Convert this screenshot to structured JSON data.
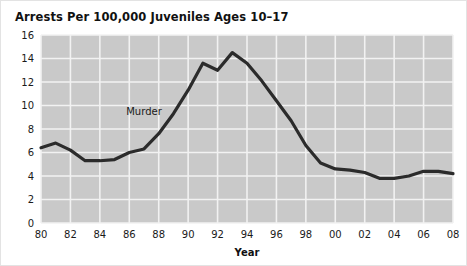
{
  "chart_data": {
    "type": "line",
    "title": "Arrests Per 100,000 Juveniles Ages 10–17",
    "xlabel": "Year",
    "ylabel": "",
    "xlim": [
      1980,
      2008
    ],
    "ylim": [
      0,
      16
    ],
    "grid": true,
    "legend_position": "inline-annotation",
    "y_ticks": [
      0,
      2,
      4,
      6,
      8,
      10,
      12,
      14,
      16
    ],
    "y_tick_labels": [
      "0",
      "2",
      "4",
      "6",
      "8",
      "10",
      "12",
      "14",
      "16"
    ],
    "x_ticks": [
      1980,
      1982,
      1984,
      1986,
      1988,
      1990,
      1992,
      1994,
      1996,
      1998,
      2000,
      2002,
      2004,
      2006,
      2008
    ],
    "x_tick_labels": [
      "80",
      "82",
      "84",
      "86",
      "88",
      "90",
      "92",
      "94",
      "96",
      "98",
      "00",
      "02",
      "04",
      "06",
      "08"
    ],
    "annotations": [
      {
        "text": "Murder",
        "x": 1987,
        "y": 9.2
      }
    ],
    "series": [
      {
        "name": "Murder",
        "color": "#2b2b2b",
        "x": [
          1980,
          1981,
          1982,
          1983,
          1984,
          1985,
          1986,
          1987,
          1988,
          1989,
          1990,
          1991,
          1992,
          1993,
          1994,
          1995,
          1996,
          1997,
          1998,
          1999,
          2000,
          2001,
          2002,
          2003,
          2004,
          2005,
          2006,
          2007,
          2008
        ],
        "values": [
          6.4,
          6.8,
          6.2,
          5.3,
          5.3,
          5.4,
          6.0,
          6.3,
          7.6,
          9.3,
          11.3,
          13.6,
          13.0,
          14.5,
          13.6,
          12.1,
          10.4,
          8.7,
          6.6,
          5.1,
          4.6,
          4.5,
          4.3,
          3.8,
          3.8,
          4.0,
          4.4,
          4.4,
          4.2
        ]
      }
    ],
    "colors": {
      "plot_background": "#c9c9c9",
      "gridline": "#f2f2f2",
      "line": "#2b2b2b",
      "text": "#1a1a1a",
      "figure_background": "#ffffff",
      "figure_border": "#e3e3e3"
    }
  }
}
